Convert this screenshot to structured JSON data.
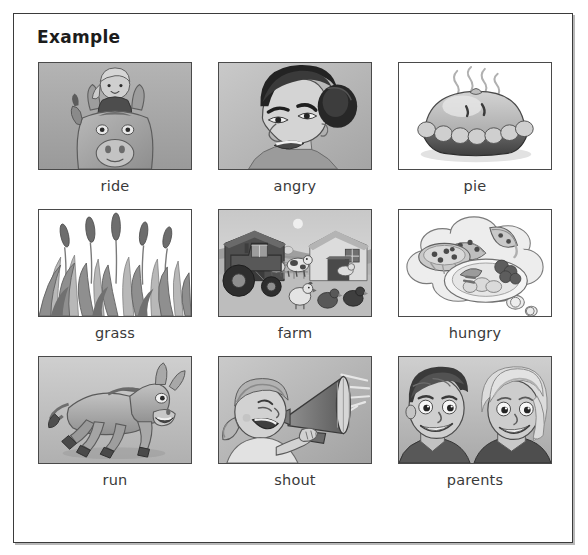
{
  "worksheet": {
    "heading": "Example",
    "frame_color": "#3b3b3b",
    "background": "#ffffff",
    "label_color": "#3a3a3a"
  },
  "grid": {
    "columns": 3,
    "rows": 3,
    "cells": [
      {
        "label": "ride",
        "picture": "girl-riding-donkey"
      },
      {
        "label": "angry",
        "picture": "angry-woman-face"
      },
      {
        "label": "pie",
        "picture": "steaming-pie"
      },
      {
        "label": "grass",
        "picture": "tall-grass-with-seed-heads"
      },
      {
        "label": "farm",
        "picture": "farm-scene-tractor-barn-animals"
      },
      {
        "label": "hungry",
        "picture": "thought-bubble-of-food"
      },
      {
        "label": "run",
        "picture": "running-donkey"
      },
      {
        "label": "shout",
        "picture": "girl-shouting-into-megaphone"
      },
      {
        "label": "parents",
        "picture": "man-and-woman-faces"
      }
    ]
  }
}
